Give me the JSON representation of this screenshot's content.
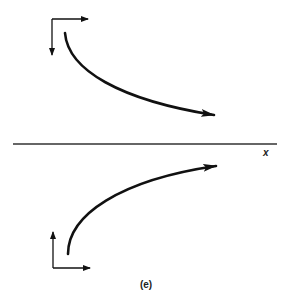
{
  "figure": {
    "caption": "(e)",
    "axis_label": "x",
    "stroke_color": "#111111",
    "background": "#ffffff"
  },
  "elements": {
    "upper_axes_icon": {
      "description": "coordinate axes: right arrow and downward arrow"
    },
    "upper_curve": {
      "description": "curve starting near top, descending and flattening, arrow pointing right"
    },
    "horizontal_axis": {
      "label": "x"
    },
    "lower_curve": {
      "description": "curve starting near bottom, rising and flattening, arrow pointing right"
    },
    "lower_axes_icon": {
      "description": "coordinate axes: upward arrow and right arrow"
    }
  }
}
